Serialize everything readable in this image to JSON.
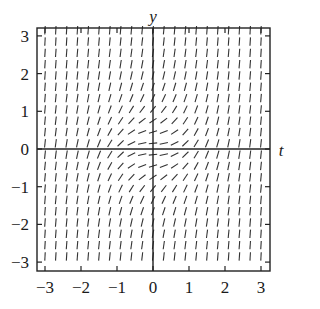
{
  "figure": {
    "type": "slope field",
    "equation_hint": "dy/dt = t^2 + y^2",
    "x_axis_label": "t",
    "y_axis_label": "y",
    "x_ticks": [
      "-3",
      "-2",
      "-1",
      "0",
      "1",
      "2",
      "3"
    ],
    "y_ticks": [
      "3",
      "2",
      "1",
      "0",
      "-1",
      "-2",
      "-3"
    ],
    "x_range": [
      -3.3,
      3.3
    ],
    "y_range": [
      -3.3,
      3.3
    ],
    "grid_step": 0.3,
    "colors": {
      "lines": "#222222",
      "background": "#ffffff"
    }
  }
}
